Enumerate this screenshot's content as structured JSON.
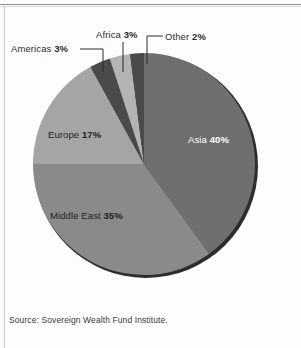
{
  "figure": {
    "width": 301,
    "height": 348,
    "background": "#fdfdfd",
    "rule_color": "#8b8b8b"
  },
  "source": {
    "text": "Source: Sovereign Wealth Fund Institute."
  },
  "chart_data": {
    "type": "pie",
    "title": "",
    "subtitle": "",
    "xlabel": "",
    "ylabel": "",
    "legend_position": "none",
    "grid": false,
    "units": "percent",
    "total": 100,
    "categories": [
      "Asia",
      "Middle East",
      "Europe",
      "Americas",
      "Africa",
      "Other"
    ],
    "values": [
      40,
      35,
      17,
      3,
      3,
      2
    ],
    "start_angle_deg": 0,
    "direction": "clockwise",
    "slices": [
      {
        "name": "Asia",
        "label": "Asia",
        "value": 40,
        "value_label": "40%",
        "color": "#6f6f6f",
        "label_color": "#ffffff",
        "label_placement": "inside",
        "start_deg": 0,
        "end_deg": 144
      },
      {
        "name": "Middle East",
        "label": "Middle East",
        "value": 35,
        "value_label": "35%",
        "color": "#8a8a8a",
        "label_color": "#1f1f1f",
        "label_placement": "inside",
        "start_deg": 144,
        "end_deg": 270
      },
      {
        "name": "Europe",
        "label": "Europe",
        "value": 17,
        "value_label": "17%",
        "color": "#a5a5a5",
        "label_color": "#1f1f1f",
        "label_placement": "inside",
        "start_deg": 270,
        "end_deg": 331.2
      },
      {
        "name": "Americas",
        "label": "Americas",
        "value": 3,
        "value_label": "3%",
        "color": "#4a4a4a",
        "label_color": "#2b2b2b",
        "label_placement": "callout",
        "start_deg": 331.2,
        "end_deg": 342
      },
      {
        "name": "Africa",
        "label": "Africa",
        "value": 3,
        "value_label": "3%",
        "color": "#b4b4b4",
        "label_color": "#2b2b2b",
        "label_placement": "callout",
        "start_deg": 342,
        "end_deg": 352.8
      },
      {
        "name": "Other",
        "label": "Other",
        "value": 2,
        "value_label": "2%",
        "color": "#4a4a4a",
        "label_color": "#2b2b2b",
        "label_placement": "callout",
        "start_deg": 352.8,
        "end_deg": 360
      }
    ],
    "geometry": {
      "center_x": 144,
      "center_y": 164,
      "radius": 111,
      "rim_color": "#2d2d2d"
    },
    "annotations": [
      {
        "name": "americas-callout",
        "text_label": "Americas",
        "text_value": "3%"
      },
      {
        "name": "africa-callout",
        "text_label": "Africa",
        "text_value": "3%"
      },
      {
        "name": "other-callout",
        "text_label": "Other",
        "text_value": "2%"
      }
    ]
  }
}
